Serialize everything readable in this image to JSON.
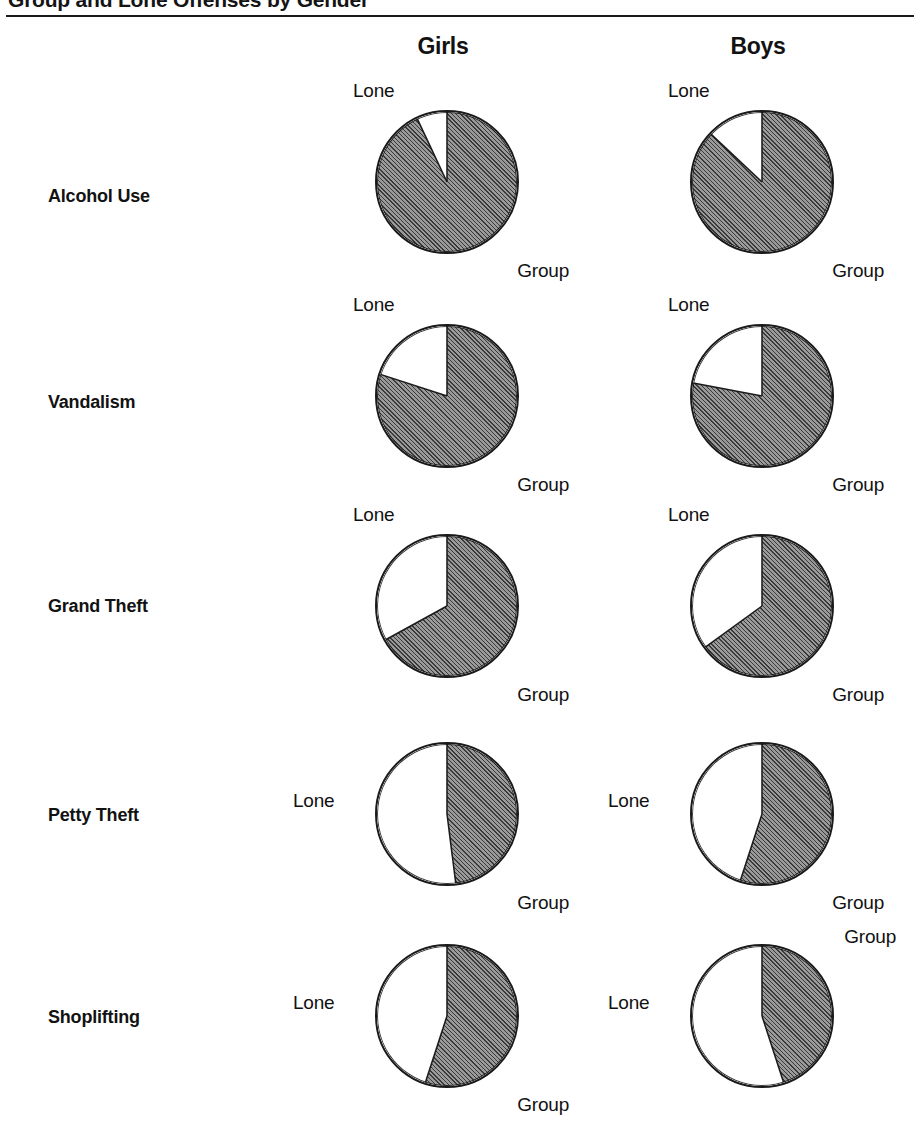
{
  "figure": {
    "title": "Group and Lone Offenses by Gender",
    "columns": [
      "Girls",
      "Boys"
    ],
    "slice_labels": {
      "lone": "Lone",
      "group": "Group"
    },
    "colors": {
      "group_fill": "#9a9a9a",
      "lone_fill": "#ffffff",
      "outline": "#1a1a1a",
      "text": "#121212"
    }
  },
  "chart_data": {
    "type": "pie",
    "title": "Group and Lone Offenses by Gender",
    "xlabel": "",
    "ylabel": "",
    "units": "percent",
    "slice_order": [
      "Group",
      "Lone"
    ],
    "legend": [
      "Group",
      "Lone"
    ],
    "legend_position": "inline-annotations",
    "grid": false,
    "note": "Each pie shows the share of offenses committed in a group versus alone; the Lone wedge starts at 12 o'clock and runs counter-clockwise.",
    "categories": [
      "Alcohol Use",
      "Vandalism",
      "Grand Theft",
      "Petty Theft",
      "Shoplifting"
    ],
    "groups": [
      "Girls",
      "Boys"
    ],
    "pies": [
      {
        "offense": "Alcohol Use",
        "gender": "Girls",
        "labels": [
          "Group",
          "Lone"
        ],
        "values": [
          93,
          7
        ],
        "lone_label_pos": "top-left",
        "group_label_pos": "bottom-right"
      },
      {
        "offense": "Alcohol Use",
        "gender": "Boys",
        "labels": [
          "Group",
          "Lone"
        ],
        "values": [
          87,
          13
        ],
        "lone_label_pos": "top-left",
        "group_label_pos": "bottom-right"
      },
      {
        "offense": "Vandalism",
        "gender": "Girls",
        "labels": [
          "Group",
          "Lone"
        ],
        "values": [
          80,
          20
        ],
        "lone_label_pos": "top-left",
        "group_label_pos": "bottom-right"
      },
      {
        "offense": "Vandalism",
        "gender": "Boys",
        "labels": [
          "Group",
          "Lone"
        ],
        "values": [
          78,
          22
        ],
        "lone_label_pos": "top-left",
        "group_label_pos": "bottom-right"
      },
      {
        "offense": "Grand Theft",
        "gender": "Girls",
        "labels": [
          "Group",
          "Lone"
        ],
        "values": [
          67,
          33
        ],
        "lone_label_pos": "top-left",
        "group_label_pos": "bottom-right"
      },
      {
        "offense": "Grand Theft",
        "gender": "Boys",
        "labels": [
          "Group",
          "Lone"
        ],
        "values": [
          65,
          35
        ],
        "lone_label_pos": "top-left",
        "group_label_pos": "bottom-right"
      },
      {
        "offense": "Petty Theft",
        "gender": "Girls",
        "labels": [
          "Group",
          "Lone"
        ],
        "values": [
          48,
          52
        ],
        "lone_label_pos": "mid-left",
        "group_label_pos": "bottom-right"
      },
      {
        "offense": "Petty Theft",
        "gender": "Boys",
        "labels": [
          "Group",
          "Lone"
        ],
        "values": [
          55,
          45
        ],
        "lone_label_pos": "mid-left",
        "group_label_pos": "bottom-right"
      },
      {
        "offense": "Shoplifting",
        "gender": "Girls",
        "labels": [
          "Group",
          "Lone"
        ],
        "values": [
          55,
          45
        ],
        "lone_label_pos": "mid-left",
        "group_label_pos": "bottom-right"
      },
      {
        "offense": "Shoplifting",
        "gender": "Boys",
        "labels": [
          "Group",
          "Lone"
        ],
        "values": [
          45,
          55
        ],
        "lone_label_pos": "mid-left",
        "group_label_pos": "top-right"
      }
    ]
  },
  "layout": {
    "rows": [
      {
        "label": "Alcohol Use",
        "label_top": 186,
        "cell_top": 86
      },
      {
        "label": "Vandalism",
        "label_top": 392,
        "cell_top": 300
      },
      {
        "label": "Grand Theft",
        "label_top": 596,
        "cell_top": 510
      },
      {
        "label": "Petty Theft",
        "label_top": 805,
        "cell_top": 718
      },
      {
        "label": "Shoplifting",
        "label_top": 1007,
        "cell_top": 920
      }
    ],
    "cols": [
      {
        "name": "Girls",
        "left": 347
      },
      {
        "name": "Boys",
        "left": 662
      }
    ]
  }
}
